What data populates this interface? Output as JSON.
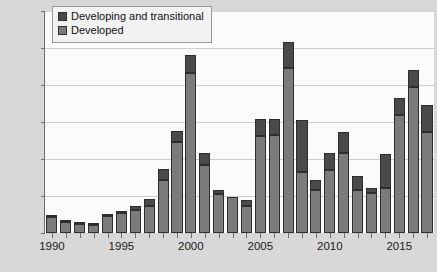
{
  "chart_data": {
    "type": "bar",
    "stacked": true,
    "title": "",
    "xlabel": "",
    "ylabel": "$ billions",
    "ylim": [
      0,
      1200
    ],
    "ytick_step": 200,
    "yticks": [
      "0",
      "200",
      "400",
      "600",
      "800",
      "1000",
      "1200"
    ],
    "grid": true,
    "legend_position": "top-left",
    "xtick_labels": [
      "1990",
      "1995",
      "2000",
      "2005",
      "2010",
      "2015"
    ],
    "xtick_years": [
      1990,
      1995,
      2000,
      2005,
      2010,
      2015
    ],
    "categories": [
      "1990",
      "1991",
      "1992",
      "1993",
      "1994",
      "1995",
      "1996",
      "1997",
      "1998",
      "1999",
      "2000",
      "2001",
      "2002",
      "2003",
      "2004",
      "2005",
      "2006",
      "2007",
      "2008",
      "2009",
      "2010",
      "2011",
      "2012",
      "2013",
      "2014",
      "2015",
      "2016",
      "2017"
    ],
    "series": [
      {
        "name": "Developed",
        "color": "#7b7b7b",
        "values": [
          85,
          57,
          48,
          42,
          90,
          107,
          127,
          145,
          285,
          490,
          865,
          365,
          210,
          195,
          145,
          525,
          530,
          890,
          330,
          235,
          340,
          435,
          235,
          215,
          245,
          640,
          790,
          545
        ]
      },
      {
        "name": "Developing and transitional",
        "color": "#4a4a4a",
        "values": [
          15,
          5,
          2,
          3,
          5,
          6,
          18,
          40,
          60,
          60,
          95,
          65,
          25,
          0,
          35,
          90,
          85,
          140,
          280,
          50,
          95,
          110,
          75,
          30,
          180,
          90,
          90,
          145
        ]
      }
    ],
    "totals": [
      100,
      62,
      50,
      45,
      95,
      113,
      145,
      185,
      345,
      550,
      960,
      430,
      235,
      195,
      180,
      615,
      615,
      1030,
      610,
      285,
      435,
      545,
      310,
      245,
      425,
      730,
      880,
      690
    ]
  },
  "legend": {
    "items": [
      {
        "label": "Developing and transitional",
        "swatch": "#4a4a4a"
      },
      {
        "label": "Developed",
        "swatch": "#7b7b7b"
      }
    ]
  },
  "axes": {
    "y_axis_title": "$ billions"
  }
}
